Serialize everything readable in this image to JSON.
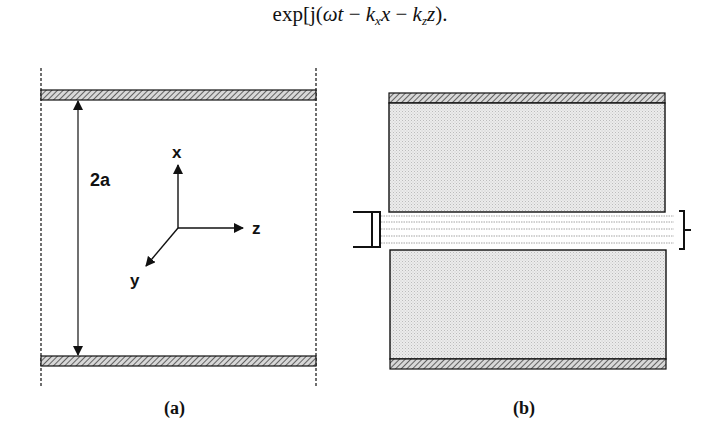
{
  "equation": {
    "prefix": "exp[j(",
    "omega_t": "ωt",
    "minus1": " − ",
    "k": "k",
    "sub_x": "x",
    "var_x": "x",
    "minus2": " − ",
    "k2": "k",
    "sub_z": "z",
    "var_z": "z",
    "suffix": ")."
  },
  "figure_a": {
    "caption": "(a)",
    "gap_label": "2a",
    "axes": {
      "x_label": "x",
      "y_label": "y",
      "z_label": "z"
    }
  },
  "figure_b": {
    "caption": "(b)"
  },
  "colors": {
    "ink": "#111111",
    "plate_hatch": "#555555",
    "dielectric_fill": "#e4e4e4",
    "beam_lines": "#999999"
  }
}
